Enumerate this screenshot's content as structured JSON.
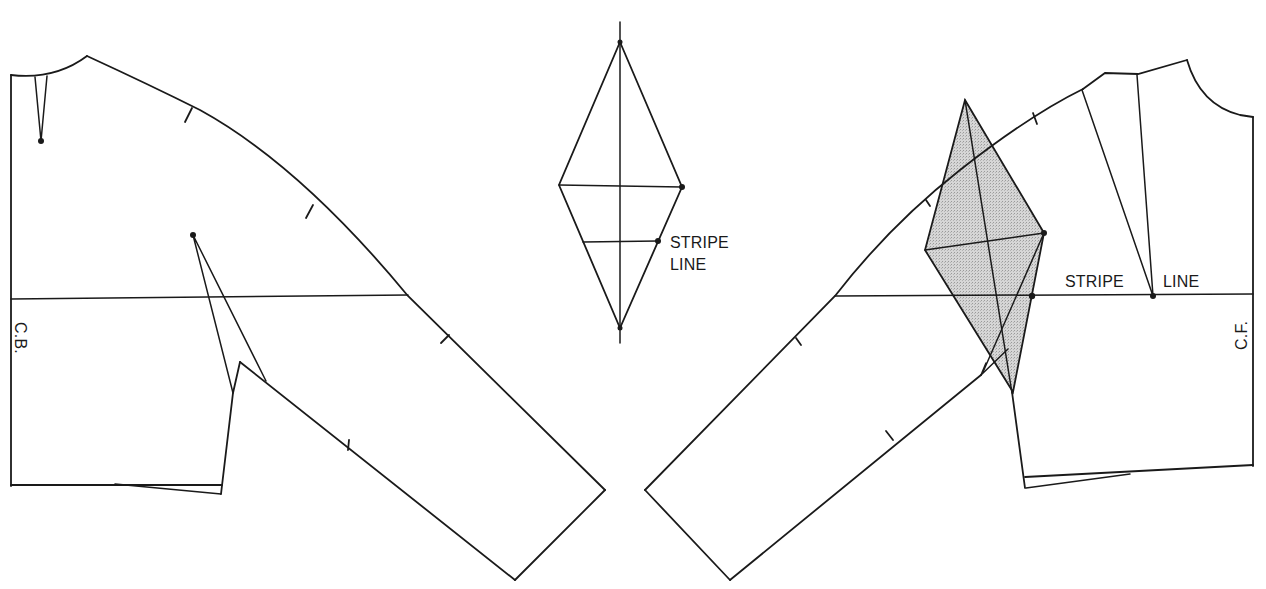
{
  "diagram": {
    "type": "sewing pattern draft",
    "left_piece": {
      "name": "back bodice with raglan sleeve",
      "center_label": "C.B.",
      "stripe_line_y": 298
    },
    "center_piece": {
      "name": "diamond insert",
      "label_line1": "STRIPE",
      "label_line2": "LINE"
    },
    "right_piece": {
      "name": "front bodice with raglan sleeve and shaded diamond gusset",
      "center_label": "C.F.",
      "stripe_label_left": "STRIPE",
      "stripe_label_right": "LINE",
      "gusset_fill": "#cfcfcf"
    },
    "colors": {
      "line": "#1a1a1a",
      "background": "#ffffff",
      "shade": "#cfcfcf"
    }
  }
}
